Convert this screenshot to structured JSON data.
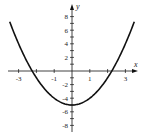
{
  "chart_data": {
    "type": "line",
    "title": "",
    "xlabel": "x",
    "ylabel": "y",
    "function": "y = x^2 - 5",
    "xlim": [
      -3.5,
      3.5
    ],
    "ylim": [
      -9,
      9
    ],
    "grid": false,
    "legend": "none",
    "x_ticks": [
      -3,
      -2,
      -1,
      0,
      1,
      2,
      3
    ],
    "x_tick_labels": [
      {
        "value": -3,
        "label": "-3"
      },
      {
        "value": -1,
        "label": "-1"
      },
      {
        "value": 1,
        "label": "1"
      },
      {
        "value": 3,
        "label": "3"
      }
    ],
    "y_ticks": [
      -8,
      -7,
      -6,
      -5,
      -4,
      -3,
      -2,
      -1,
      1,
      2,
      3,
      4,
      5,
      6,
      7,
      8
    ],
    "y_tick_labels": [
      {
        "value": 8,
        "label": "8"
      },
      {
        "value": 6,
        "label": "6"
      },
      {
        "value": 4,
        "label": "4"
      },
      {
        "value": 2,
        "label": "2"
      },
      {
        "value": -2,
        "label": "-2"
      },
      {
        "value": -4,
        "label": "-4"
      },
      {
        "value": -6,
        "label": "-6"
      },
      {
        "value": -8,
        "label": "-8"
      }
    ],
    "series": [
      {
        "name": "parabola",
        "x": [
          -3.5,
          -3,
          -2.5,
          -2,
          -1.5,
          -1,
          -0.5,
          0,
          0.5,
          1,
          1.5,
          2,
          2.5,
          3,
          3.5
        ],
        "y": [
          7.25,
          4,
          1.25,
          -1,
          -2.75,
          -4,
          -4.75,
          -5,
          -4.75,
          -4,
          -2.75,
          -1,
          1.25,
          4,
          7.25
        ]
      }
    ],
    "key_points": {
      "vertex": [
        0,
        -5
      ],
      "x_intercepts": [
        -2.236,
        2.236
      ]
    },
    "color": "#111111"
  }
}
